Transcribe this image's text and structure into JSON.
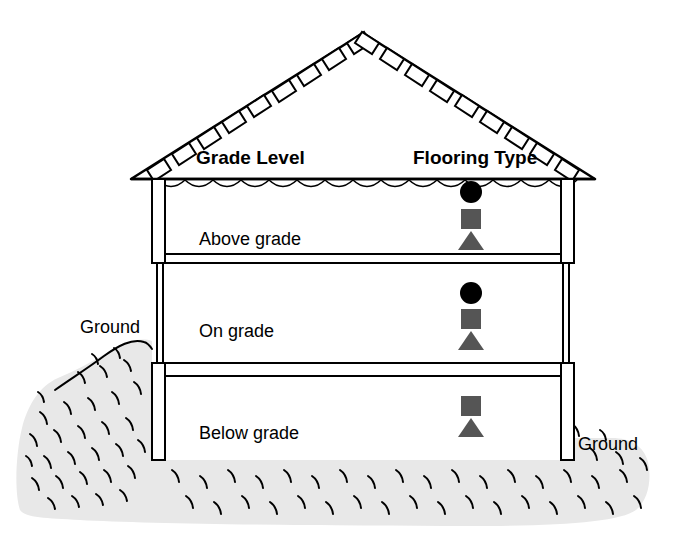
{
  "diagram": {
    "title_columns": {
      "grade_level": "Grade Level",
      "flooring_type": "Flooring Type"
    },
    "levels": [
      {
        "id": "above-grade",
        "label": "Above grade",
        "markers": [
          "circle",
          "square",
          "triangle"
        ]
      },
      {
        "id": "on-grade",
        "label": "On grade",
        "markers": [
          "circle",
          "square",
          "triangle"
        ]
      },
      {
        "id": "below-grade",
        "label": "Below grade",
        "markers": [
          "square",
          "triangle"
        ]
      }
    ],
    "ground_labels": {
      "left": "Ground",
      "right": "Ground"
    },
    "colors": {
      "circle_marker": "#000000",
      "square_marker": "#555555",
      "triangle_marker": "#555555",
      "ground_fill": "#e8e8e8",
      "outline": "#000000",
      "background": "#ffffff"
    }
  }
}
